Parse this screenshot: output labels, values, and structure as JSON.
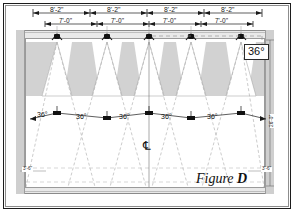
{
  "figure": {
    "label_prefix": "Figure",
    "label_id": "D",
    "centerline_symbol": "℄"
  },
  "dimensions": {
    "top_row": {
      "label": "8'-2\"",
      "values": [
        "8'-2\"",
        "8'-2\"",
        "8'-2\"",
        "8'-2\""
      ],
      "count": 4
    },
    "second_row": {
      "label": "7'-0\"",
      "values": [
        "7'-0\"",
        "7'-0\"",
        "7'-0\"",
        "7'-0\""
      ],
      "count": 4
    },
    "right_vertical": "26'-0\"",
    "bottom_left_offset": "3'-6\"",
    "bottom_right_offset": "3'-6\""
  },
  "angles": {
    "beam_callout": "36°",
    "spread_labels": [
      "36°",
      "36°",
      "36°",
      "36°",
      "36°"
    ],
    "spread_count": 5
  },
  "fixtures": {
    "count": 5,
    "symbol_name": "recessed-downlight-symbol",
    "x_positions": [
      57,
      107,
      149,
      191,
      241
    ]
  },
  "colors": {
    "page_background": "#ffffff",
    "frame_dark": "#1c1c1c",
    "frame_light": "#8d8d8d",
    "room_fill": "#e9e9e9",
    "jamb_fill": "#cfcfcf",
    "bay_shade": "#d2d2d2",
    "cone_fill": "#ffffff",
    "line_dark": "#1a1a1a",
    "line_light": "#b4b4b4",
    "text": "#111111"
  }
}
